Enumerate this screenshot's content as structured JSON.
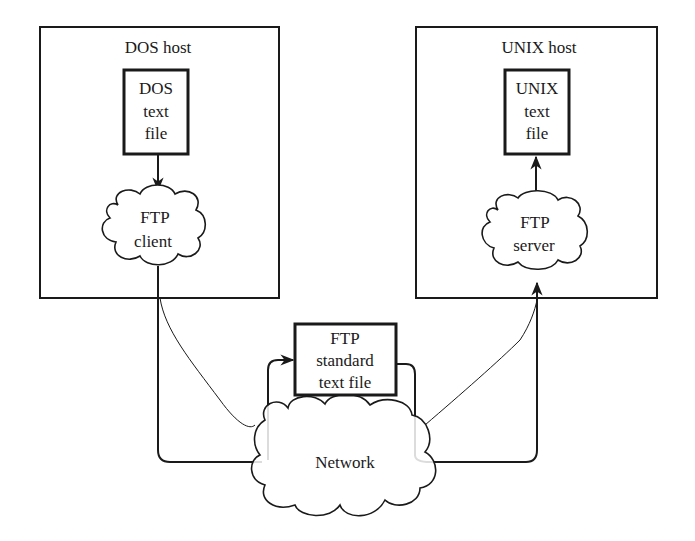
{
  "diagram": {
    "hosts": [
      {
        "id": "dos",
        "label": "DOS host"
      },
      {
        "id": "unix",
        "label": "UNIX host"
      }
    ],
    "files": {
      "dos": {
        "lines": [
          "DOS",
          "text",
          "file"
        ]
      },
      "unix": {
        "lines": [
          "UNIX",
          "text",
          "file"
        ]
      },
      "standard": {
        "lines": [
          "FTP",
          "standard",
          "text file"
        ]
      }
    },
    "processes": {
      "client": {
        "lines": [
          "FTP",
          "client"
        ]
      },
      "server": {
        "lines": [
          "FTP",
          "server"
        ]
      }
    },
    "network": {
      "label": "Network"
    },
    "colors": {
      "line": "#1a1a1a",
      "background": "#ffffff"
    }
  }
}
